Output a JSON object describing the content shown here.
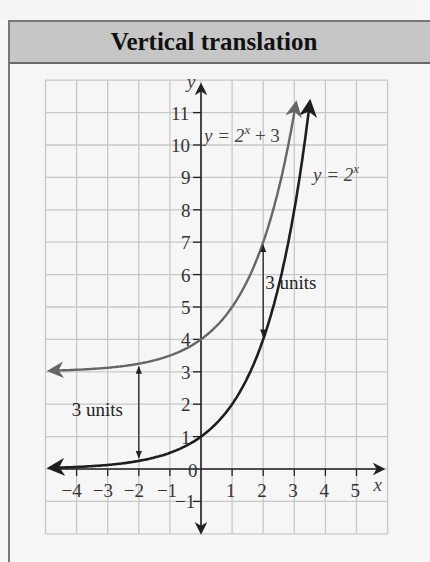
{
  "panel": {
    "title": "Vertical translation"
  },
  "chart_data": {
    "type": "line",
    "title": "Vertical translation",
    "xlabel": "x",
    "ylabel": "y",
    "xlim": [
      -5,
      6
    ],
    "ylim": [
      -2,
      12
    ],
    "grid": true,
    "x_tick_labels": [
      "−4",
      "−3",
      "−2",
      "−1",
      "0",
      "1",
      "2",
      "3",
      "4",
      "5"
    ],
    "y_tick_labels": [
      "−1",
      "1",
      "2",
      "3",
      "4",
      "5",
      "6",
      "7",
      "8",
      "9",
      "10",
      "11"
    ],
    "series": [
      {
        "name": "y = 2^x",
        "label_text": "y = 2",
        "label_sup": "x",
        "color": "#1e1e1e",
        "x": [
          -4,
          -3,
          -2,
          -1,
          0,
          1,
          2,
          3,
          3.5
        ],
        "y": [
          0.0625,
          0.125,
          0.25,
          0.5,
          1,
          2,
          4,
          8,
          11.3
        ]
      },
      {
        "name": "y = 2^x + 3",
        "label_text": "y = 2",
        "label_sup": "x",
        "label_suffix": " + 3",
        "color": "#666666",
        "x": [
          -4.9,
          -4,
          -3,
          -2,
          -1,
          0,
          1,
          2,
          3
        ],
        "y": [
          3.03,
          3.0625,
          3.125,
          3.25,
          3.5,
          4,
          5,
          7,
          11
        ]
      }
    ],
    "annotations": [
      {
        "text": "3 units",
        "x": -2,
        "from_y": 0.25,
        "to_y": 3.25
      },
      {
        "text": "3 units",
        "x": 2,
        "from_y": 4,
        "to_y": 7
      }
    ],
    "asymptote_arrows": "left-pointing arrows on both curves; upward arrows at top ends"
  }
}
